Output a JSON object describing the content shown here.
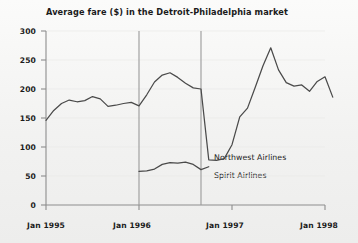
{
  "chart_data": {
    "type": "line",
    "title": "Average fare ($) in the Detroit-Philadelphia market",
    "xlabel": "",
    "ylabel": "",
    "ylim": [
      0,
      300
    ],
    "yticks": [
      0,
      50,
      100,
      150,
      200,
      250,
      300
    ],
    "ytick_labels": [
      "0",
      "50",
      "100",
      "150",
      "200",
      "250",
      "300"
    ],
    "xlim": [
      0,
      36
    ],
    "xticks": [
      0,
      12,
      24,
      36
    ],
    "xtick_labels": [
      "Jan 1995",
      "Jan 1996",
      "Jan 1997",
      "Jan 1998"
    ],
    "grid": false,
    "legend_position": "inside-right",
    "vertical_markers": [
      12,
      20
    ],
    "series": [
      {
        "name": "Northwest Airlines",
        "color": "#4a4a4a",
        "x": [
          0,
          1,
          2,
          3,
          4,
          5,
          6,
          7,
          8,
          9,
          10,
          11,
          12,
          13,
          14,
          15,
          16,
          17,
          18,
          19,
          20,
          21,
          22,
          23,
          24,
          25,
          26,
          27,
          28,
          29,
          30,
          31,
          32,
          33,
          34,
          35,
          36
        ],
        "values": [
          146,
          163,
          175,
          181,
          178,
          180,
          187,
          183,
          170,
          172,
          175,
          177,
          171,
          190,
          212,
          224,
          228,
          220,
          210,
          202,
          200,
          78,
          77,
          80,
          104,
          152,
          167,
          203,
          240,
          271,
          233,
          211,
          205,
          207,
          196,
          213,
          221
        ],
        "values_tail": [
          186
        ]
      },
      {
        "name": "Spirit Airlines",
        "color": "#4a4a4a",
        "x": [
          12,
          13,
          14,
          15,
          16,
          17,
          18,
          19,
          20,
          21
        ],
        "values": [
          58,
          59,
          62,
          70,
          73,
          72,
          74,
          70,
          61,
          66
        ]
      }
    ],
    "annotations": [
      {
        "text": "Northwest Airlines",
        "x": 22.5,
        "y": 88
      },
      {
        "text": "Spirit Airlines",
        "x": 22.5,
        "y": 58
      }
    ]
  },
  "colors": {
    "background": "#f4f4f3",
    "axis": "#8a8a8a",
    "line": "#4a4a4a",
    "text": "#1b1b1b",
    "marker": "#9a9a9a"
  }
}
